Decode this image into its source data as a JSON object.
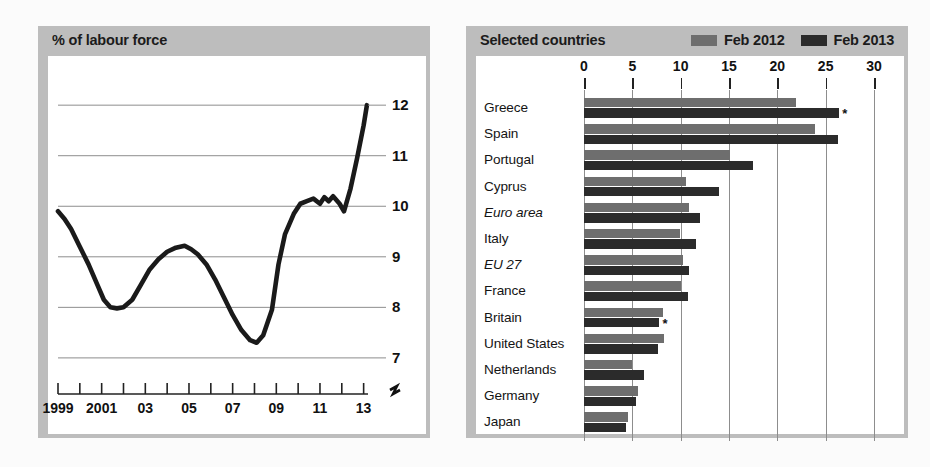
{
  "left_panel": {
    "title": "% of labour force"
  },
  "right_panel": {
    "title": "Selected countries",
    "legend": [
      {
        "label": "Feb 2012",
        "color": "#6e6e6e",
        "key": "v2012"
      },
      {
        "label": "Feb 2013",
        "color": "#2b2b2b",
        "key": "v2013"
      }
    ]
  },
  "chart_data": [
    {
      "type": "line",
      "title": "% of labour force",
      "xlabel": "",
      "ylabel": "% of labour force",
      "ylim": [
        6.8,
        12.3
      ],
      "xlim": [
        1999,
        2013.2
      ],
      "grid": true,
      "axis_break": true,
      "ytick_labels": [
        "12",
        "11",
        "10",
        "9",
        "8",
        "7"
      ],
      "yticks": [
        12,
        11,
        10,
        9,
        8,
        7
      ],
      "xtick_labels": [
        "1999",
        "2001",
        "03",
        "05",
        "07",
        "09",
        "11",
        "13"
      ],
      "xticks": [
        1999,
        2001,
        2003,
        2005,
        2007,
        2009,
        2011,
        2013
      ],
      "xminor": [
        1999,
        2000,
        2001,
        2002,
        2003,
        2004,
        2005,
        2006,
        2007,
        2008,
        2009,
        2010,
        2011,
        2012,
        2013
      ],
      "line_color": "#1a1a1a",
      "series": [
        {
          "name": "Euro area unemployment rate",
          "x": [
            1999.0,
            1999.3,
            1999.6,
            2000.0,
            2000.4,
            2000.8,
            2001.1,
            2001.4,
            2001.7,
            2002.0,
            2002.4,
            2002.8,
            2003.2,
            2003.6,
            2004.0,
            2004.4,
            2004.8,
            2005.1,
            2005.4,
            2005.8,
            2006.2,
            2006.6,
            2007.0,
            2007.4,
            2007.8,
            2008.1,
            2008.4,
            2008.8,
            2009.1,
            2009.4,
            2009.8,
            2010.1,
            2010.4,
            2010.7,
            2011.0,
            2011.2,
            2011.4,
            2011.6,
            2011.9,
            2012.1,
            2012.4,
            2012.7,
            2013.0,
            2013.15
          ],
          "y": [
            9.9,
            9.75,
            9.55,
            9.2,
            8.85,
            8.45,
            8.15,
            8.0,
            7.98,
            8.0,
            8.15,
            8.45,
            8.75,
            8.95,
            9.1,
            9.18,
            9.22,
            9.15,
            9.05,
            8.85,
            8.55,
            8.2,
            7.85,
            7.55,
            7.35,
            7.3,
            7.45,
            7.95,
            8.85,
            9.45,
            9.85,
            10.05,
            10.1,
            10.15,
            10.05,
            10.18,
            10.1,
            10.2,
            10.05,
            9.9,
            10.35,
            10.95,
            11.6,
            12.0
          ]
        }
      ]
    },
    {
      "type": "bar",
      "orientation": "horizontal",
      "title": "Selected countries",
      "xlabel": "",
      "ylabel": "",
      "xlim": [
        0,
        30
      ],
      "xticks": [
        0,
        5,
        10,
        15,
        20,
        25,
        30
      ],
      "xtick_labels": [
        "0",
        "5",
        "10",
        "15",
        "20",
        "25",
        "30"
      ],
      "grid": true,
      "categories": [
        "Greece",
        "Spain",
        "Portugal",
        "Cyprus",
        "Euro area",
        "Italy",
        "EU 27",
        "France",
        "Britain",
        "United States",
        "Netherlands",
        "Germany",
        "Japan"
      ],
      "italic_categories": [
        "Euro area",
        "EU 27"
      ],
      "series": [
        {
          "name": "Feb 2012",
          "color": "#6e6e6e",
          "values": [
            21.9,
            23.9,
            15.1,
            10.5,
            10.9,
            9.9,
            10.2,
            10.0,
            8.2,
            8.3,
            5.0,
            5.6,
            4.5
          ]
        },
        {
          "name": "Feb 2013",
          "color": "#2b2b2b",
          "values": [
            26.4,
            26.3,
            17.5,
            14.0,
            12.0,
            11.6,
            10.9,
            10.8,
            7.8,
            7.7,
            6.2,
            5.4,
            4.3
          ]
        }
      ],
      "annotations": [
        {
          "category": "Greece",
          "series": "Feb 2013",
          "marker": "*"
        },
        {
          "category": "Britain",
          "series": "Feb 2013",
          "marker": "*"
        }
      ]
    }
  ]
}
